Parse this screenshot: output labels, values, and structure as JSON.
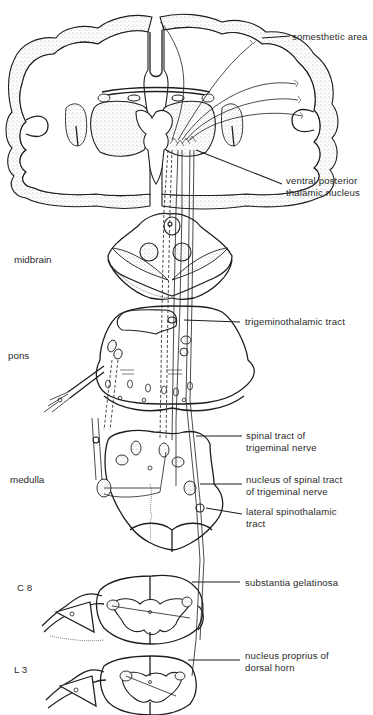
{
  "figure": {
    "regions": [
      {
        "id": "midbrain",
        "label": "midbrain"
      },
      {
        "id": "pons",
        "label": "pons"
      },
      {
        "id": "medulla",
        "label": "medulla"
      },
      {
        "id": "c8",
        "label": "C 8"
      },
      {
        "id": "l3",
        "label": "L 3"
      }
    ],
    "callouts": [
      {
        "id": "somesthetic-area",
        "lines": [
          "somesthetic area"
        ]
      },
      {
        "id": "ventral-posterior-thalamic-nucleus",
        "lines": [
          "ventral posterior",
          "thalamic nucleus"
        ]
      },
      {
        "id": "trigeminothalamic-tract",
        "lines": [
          "trigeminothalamic tract"
        ]
      },
      {
        "id": "spinal-tract-of-trigeminal-nerve",
        "lines": [
          "spinal tract of",
          "trigeminal nerve"
        ]
      },
      {
        "id": "nucleus-of-spinal-tract",
        "lines": [
          "nucleus of spinal tract",
          "of trigeminal nerve"
        ]
      },
      {
        "id": "lateral-spinothalamic-tract",
        "lines": [
          "lateral spinothalamic",
          "tract"
        ]
      },
      {
        "id": "substantia-gelatinosa",
        "lines": [
          "substantia gelatinosa"
        ]
      },
      {
        "id": "nucleus-proprius",
        "lines": [
          "nucleus proprius of",
          "dorsal horn"
        ]
      }
    ],
    "colors": {
      "ink": "#1e1e1e",
      "background": "#ffffff",
      "stipple": "#8a8a8a"
    }
  }
}
